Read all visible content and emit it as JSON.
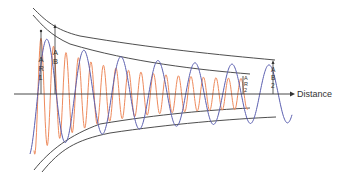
{
  "diagram": {
    "axis": {
      "label": "Distance"
    },
    "labels": {
      "ar1": [
        "A",
        "R",
        "1"
      ],
      "ab1": [
        "A",
        "B",
        "1"
      ],
      "ar2": [
        "A",
        "R",
        "2"
      ],
      "ab2": [
        "A",
        "B",
        "2"
      ]
    },
    "colors": {
      "blue_wave": "#5b5fb0",
      "red_wave": "#ee8a5c",
      "envelope": "#3a3a3a",
      "axis": "#333333"
    },
    "series": [
      {
        "name": "blue wave",
        "wavelength": "long",
        "decay": "slow"
      },
      {
        "name": "red wave",
        "wavelength": "short",
        "decay": "fast"
      }
    ]
  }
}
